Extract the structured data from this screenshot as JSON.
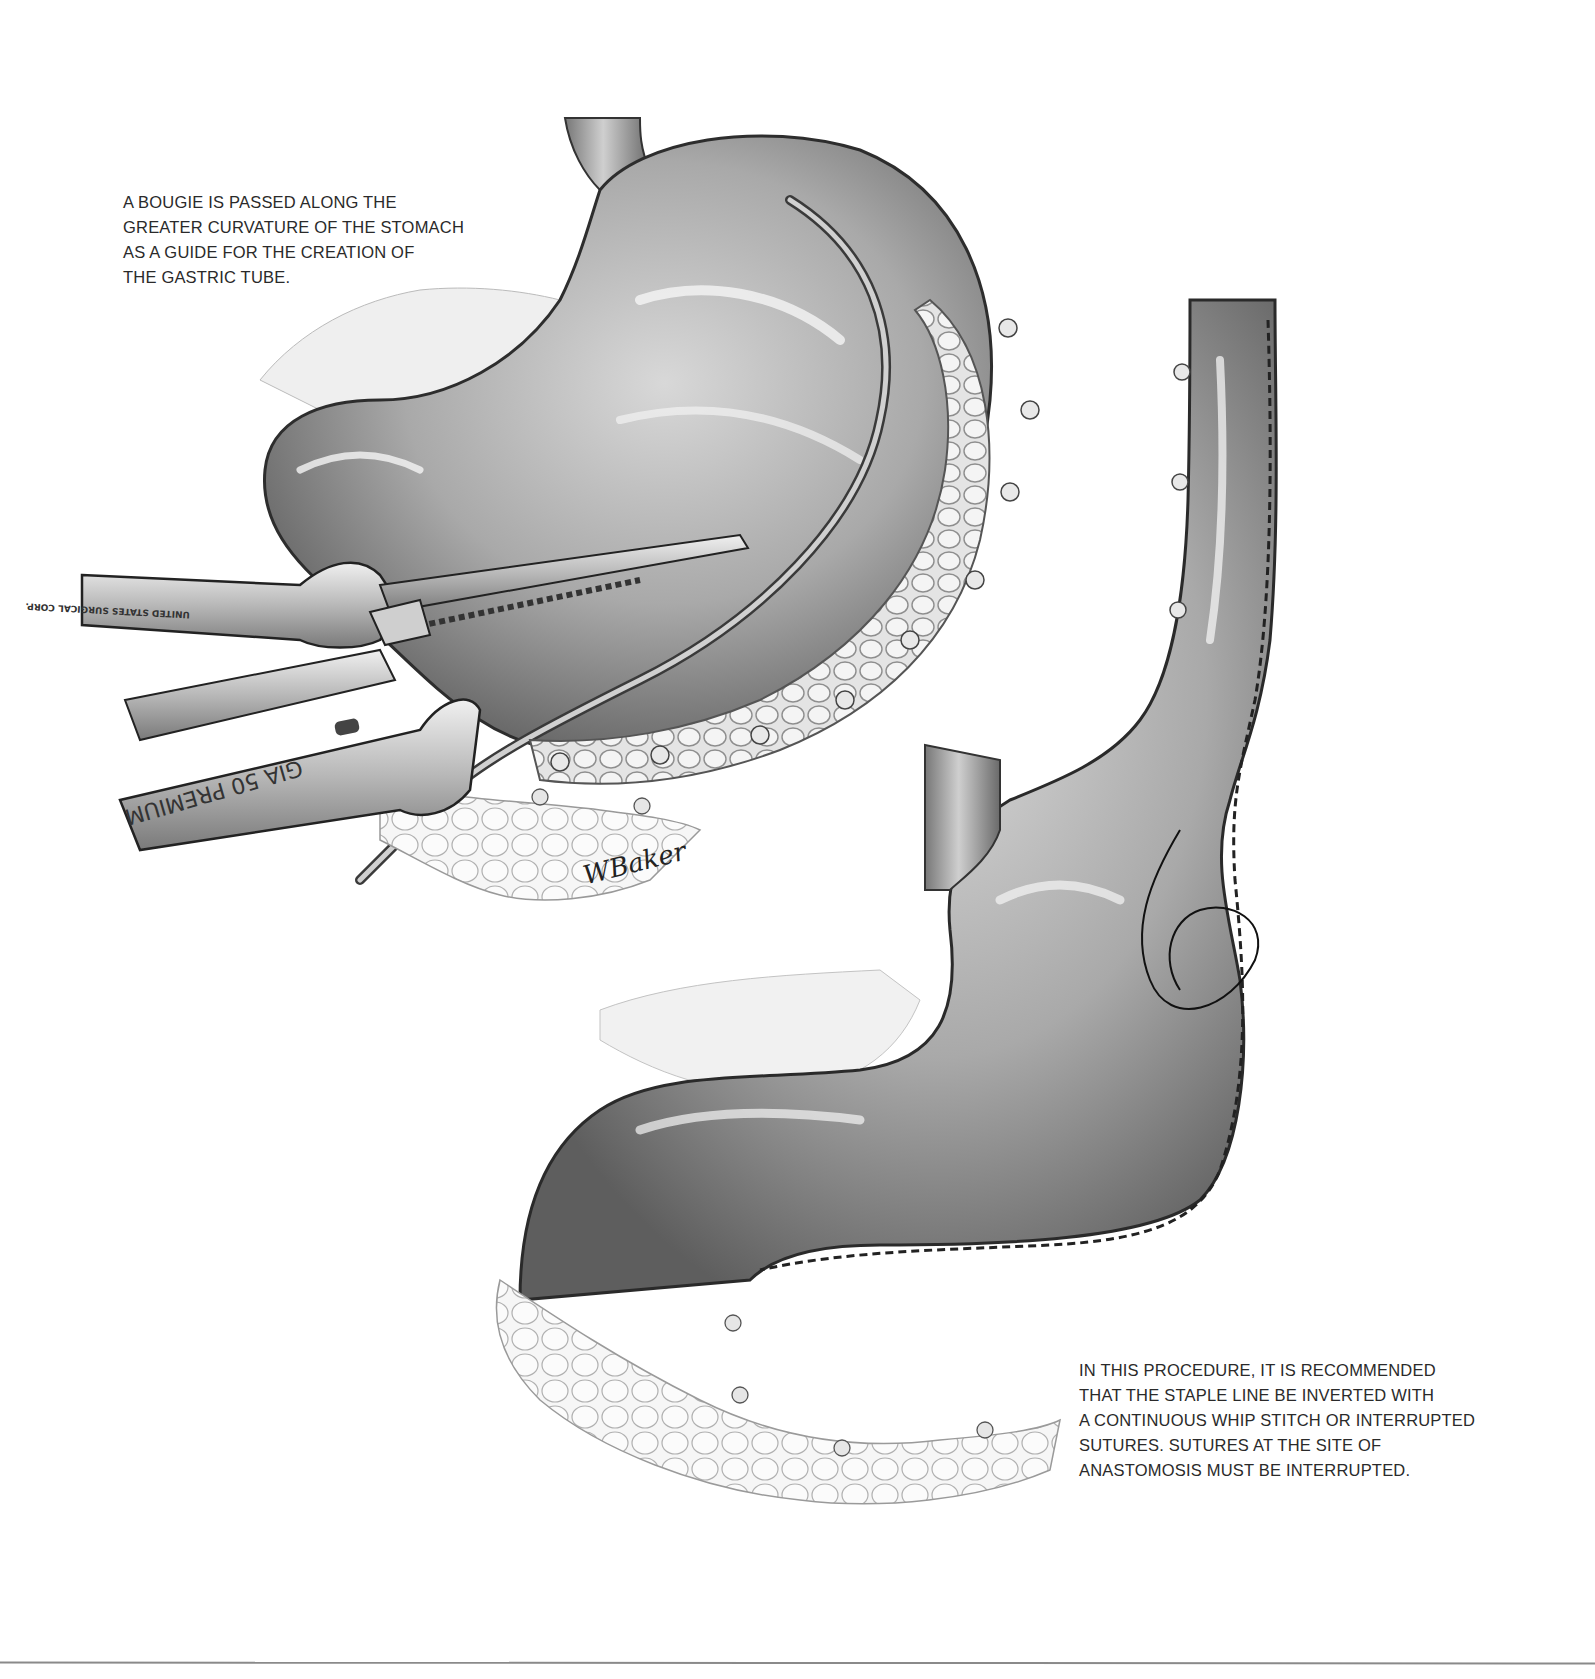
{
  "figure": {
    "type": "medical-illustration",
    "background_color": "#ffffff",
    "line_color": "#8a8a8a"
  },
  "captions": {
    "top_left": {
      "lines": [
        "A BOUGIE IS PASSED ALONG THE",
        "GREATER CURVATURE OF THE STOMACH",
        "AS A GUIDE FOR THE CREATION OF",
        "THE GASTRIC TUBE."
      ]
    },
    "bottom_right": {
      "lines": [
        "IN THIS PROCEDURE, IT IS RECOMMENDED",
        "THAT THE STAPLE LINE BE INVERTED WITH",
        "A CONTINUOUS WHIP STITCH OR INTERRUPTED",
        "SUTURES. SUTURES AT THE SITE OF",
        "ANASTOMOSIS MUST BE INTERRUPTED."
      ]
    }
  },
  "instrument": {
    "stapler_label": "GIA 50 PREMIUM",
    "manufacturer_label": "UNITED STATES SURGICAL CORP."
  },
  "artist_signature": "WBaker"
}
